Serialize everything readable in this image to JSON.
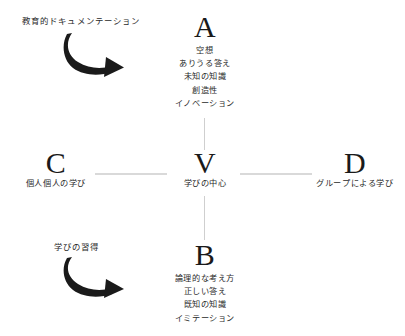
{
  "diagram": {
    "title_text": "",
    "background_color": "#ffffff",
    "text_color": "#1c1c1c",
    "connector_color": "#d9d9d9",
    "arrow_color": "#1a1a1a"
  },
  "nodes": {
    "a": {
      "letter": "A",
      "lines": [
        "空想",
        "ありうる答え",
        "未知の知識",
        "創造性",
        "イノベーション"
      ]
    },
    "b": {
      "letter": "B",
      "lines": [
        "論理的な考え方",
        "正しい答え",
        "既知の知識",
        "イミテーション"
      ]
    },
    "c": {
      "letter": "C",
      "label": "個人個人の学び"
    },
    "d": {
      "letter": "D",
      "label": "グループによる学び"
    },
    "v": {
      "letter": "V",
      "label": "学びの中心"
    }
  },
  "annotations": {
    "top": {
      "label": "教育的ドキュメンテーション",
      "icon": "curved-arrow-icon"
    },
    "bottom": {
      "label": "学びの習得",
      "icon": "curved-arrow-icon"
    }
  }
}
